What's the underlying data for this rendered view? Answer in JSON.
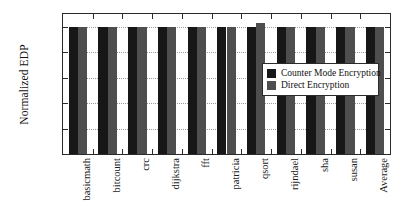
{
  "chart_data": {
    "type": "bar",
    "title": "",
    "xlabel": "",
    "ylabel": "Normalized EDP",
    "categories": [
      "basicmath",
      "bitcount",
      "crc",
      "dijkstra",
      "fft",
      "patricia",
      "qsort",
      "rijndael",
      "sha",
      "susan",
      "Average"
    ],
    "series": [
      {
        "name": "Counter Mode Encryption",
        "color": "#171717",
        "values": [
          1.0,
          1.0,
          1.0,
          1.0,
          1.0,
          1.0,
          1.0,
          1.0,
          1.0,
          1.0,
          1.0
        ]
      },
      {
        "name": "Direct Encryption",
        "color": "#4e4e4e",
        "values": [
          1.0,
          1.0,
          1.0,
          1.0,
          1.0,
          1.0,
          1.03,
          1.0,
          1.0,
          1.0,
          1.0
        ]
      }
    ],
    "ylim": [
      0,
      1.1
    ],
    "yticks": [
      0,
      0.2,
      0.4,
      0.6,
      0.8,
      1
    ],
    "ytick_labels": [
      "0",
      "0.2",
      "0.4",
      "0.6",
      "0.8",
      "1"
    ],
    "grid": "horizontal-dotted",
    "legend_position": "center-right",
    "legend": [
      {
        "label": "Counter Mode Encryption",
        "swatch": "#171717"
      },
      {
        "label": "Direct Encryption",
        "swatch": "#4e4e4e"
      }
    ]
  }
}
